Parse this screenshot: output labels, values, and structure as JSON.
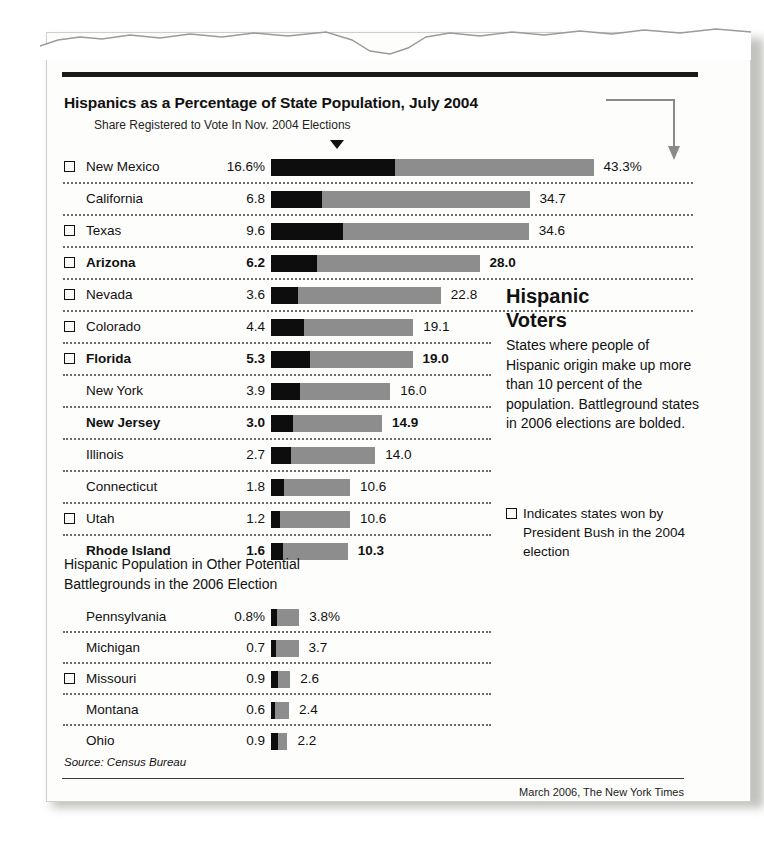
{
  "chart_data": {
    "type": "bar",
    "title": "Hispanics as a Percentage of State Population, July 2004",
    "subtitle": "Share Registered to Vote In Nov. 2004 Elections",
    "xlabel": "",
    "ylabel": "",
    "grid": false,
    "legend_position": "right",
    "axis_max": 43.3,
    "series": [
      {
        "name": "Share Registered to Vote In Nov. 2004 Elections",
        "color": "#0d0d0d"
      },
      {
        "name": "Hispanics as a Percentage of State Population, July 2004",
        "color": "#8d8d8d"
      }
    ],
    "categories": [
      "New Mexico",
      "California",
      "Texas",
      "Arizona",
      "Nevada",
      "Colorado",
      "Florida",
      "New York",
      "New Jersey",
      "Illinois",
      "Connecticut",
      "Utah",
      "Rhode Island"
    ],
    "registered_share": [
      16.6,
      6.8,
      9.6,
      6.2,
      3.6,
      4.4,
      5.3,
      3.9,
      3.0,
      2.7,
      1.8,
      1.2,
      1.6
    ],
    "population_pct": [
      43.3,
      34.7,
      34.6,
      28.0,
      22.8,
      19.1,
      19.0,
      16.0,
      14.9,
      14.0,
      10.6,
      10.6,
      10.3
    ],
    "secondary_title": "Hispanic Population in Other Potential Battlegrounds in the 2006 Election",
    "secondary_categories": [
      "Pennsylvania",
      "Michigan",
      "Missouri",
      "Montana",
      "Ohio"
    ],
    "secondary_registered_share": [
      0.8,
      0.7,
      0.9,
      0.6,
      0.9
    ],
    "secondary_population_pct": [
      3.8,
      3.7,
      2.6,
      2.4,
      2.2
    ]
  },
  "title": "Hispanics as a Percentage of State Population, July 2004",
  "subtitle": "Share Registered to Vote In Nov. 2004 Elections",
  "main_table": {
    "rows": [
      {
        "bush": true,
        "bold": false,
        "state": "New Mexico",
        "share": "16.6%",
        "total": "43.3%",
        "share_val": 16.6,
        "total_val": 43.3
      },
      {
        "bush": false,
        "bold": false,
        "state": "California",
        "share": "6.8",
        "total": "34.7",
        "share_val": 6.8,
        "total_val": 34.7
      },
      {
        "bush": true,
        "bold": false,
        "state": "Texas",
        "share": "9.6",
        "total": "34.6",
        "share_val": 9.6,
        "total_val": 34.6
      },
      {
        "bush": true,
        "bold": true,
        "state": "Arizona",
        "share": "6.2",
        "total": "28.0",
        "share_val": 6.2,
        "total_val": 28.0
      },
      {
        "bush": true,
        "bold": false,
        "state": "Nevada",
        "share": "3.6",
        "total": "22.8",
        "share_val": 3.6,
        "total_val": 22.8
      },
      {
        "bush": true,
        "bold": false,
        "state": "Colorado",
        "share": "4.4",
        "total": "19.1",
        "share_val": 4.4,
        "total_val": 19.1
      },
      {
        "bush": true,
        "bold": true,
        "state": "Florida",
        "share": "5.3",
        "total": "19.0",
        "share_val": 5.3,
        "total_val": 19.0
      },
      {
        "bush": false,
        "bold": false,
        "state": "New York",
        "share": "3.9",
        "total": "16.0",
        "share_val": 3.9,
        "total_val": 16.0
      },
      {
        "bush": false,
        "bold": true,
        "state": "New Jersey",
        "share": "3.0",
        "total": "14.9",
        "share_val": 3.0,
        "total_val": 14.9
      },
      {
        "bush": false,
        "bold": false,
        "state": "Illinois",
        "share": "2.7",
        "total": "14.0",
        "share_val": 2.7,
        "total_val": 14.0
      },
      {
        "bush": false,
        "bold": false,
        "state": "Connecticut",
        "share": "1.8",
        "total": "10.6",
        "share_val": 1.8,
        "total_val": 10.6
      },
      {
        "bush": true,
        "bold": false,
        "state": "Utah",
        "share": "1.2",
        "total": "10.6",
        "share_val": 1.2,
        "total_val": 10.6
      },
      {
        "bush": false,
        "bold": true,
        "state": "Rhode Island",
        "share": "1.6",
        "total": "10.3",
        "share_val": 1.6,
        "total_val": 10.3
      }
    ]
  },
  "secondary": {
    "heading_line1": "Hispanic Population in Other Potential",
    "heading_line2": "Battlegrounds in the 2006 Election",
    "rows": [
      {
        "bush": false,
        "bold": false,
        "state": "Pennsylvania",
        "share": "0.8%",
        "total": "3.8%",
        "share_val": 0.8,
        "total_val": 3.8
      },
      {
        "bush": false,
        "bold": false,
        "state": "Michigan",
        "share": "0.7",
        "total": "3.7",
        "share_val": 0.7,
        "total_val": 3.7
      },
      {
        "bush": true,
        "bold": false,
        "state": "Missouri",
        "share": "0.9",
        "total": "2.6",
        "share_val": 0.9,
        "total_val": 2.6
      },
      {
        "bush": false,
        "bold": false,
        "state": "Montana",
        "share": "0.6",
        "total": "2.4",
        "share_val": 0.6,
        "total_val": 2.4
      },
      {
        "bush": false,
        "bold": false,
        "state": "Ohio",
        "share": "0.9",
        "total": "2.2",
        "share_val": 0.9,
        "total_val": 2.2
      }
    ]
  },
  "sidebar": {
    "heading_line1": "Hispanic",
    "heading_line2": "Voters",
    "body": "States where people of Hispanic origin make up more than 10 percent of the population. Battleground states in 2006 elections are bolded.",
    "legend_text": "Indicates states won by President Bush in the 2004 election"
  },
  "footer": {
    "source": "Source: Census Bureau",
    "credit": "March 2006, The New York Times"
  },
  "colors": {
    "bar_total": "#8d8d8d",
    "bar_registered": "#0d0d0d",
    "rule": "#1a1a1a",
    "text": "#111111",
    "paper": "#fdfdfb"
  }
}
